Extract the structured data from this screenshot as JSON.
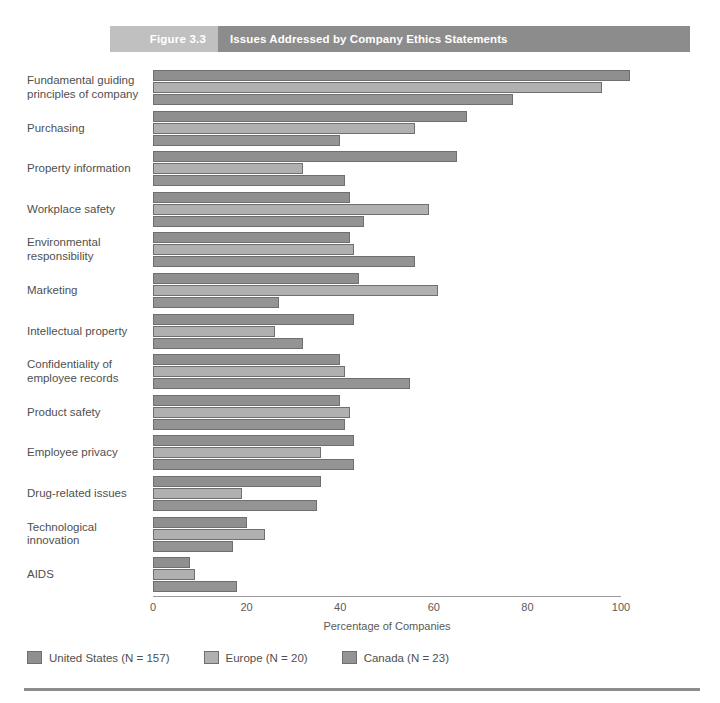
{
  "figure": {
    "number_label": "Figure 3.3",
    "title": "Issues Addressed by Company Ethics Statements"
  },
  "colors": {
    "header_num_bg": "#c0c0c0",
    "header_title_bg": "#8c8c8c",
    "united_states": "#8f8f8f",
    "europe": "#b0b0b0",
    "canada": "#949494"
  },
  "legend": {
    "items": [
      {
        "label": "United States (N = 157)",
        "color": "#8f8f8f",
        "key": "us"
      },
      {
        "label": "Europe (N = 20)",
        "color": "#b0b0b0",
        "key": "europe"
      },
      {
        "label": "Canada (N = 23)",
        "color": "#949494",
        "key": "canada"
      }
    ]
  },
  "chart_data": {
    "type": "bar",
    "orientation": "horizontal",
    "title": "Issues Addressed by Company Ethics Statements",
    "xlabel": "Percentage of Companies",
    "ylabel": "",
    "xlim": [
      0,
      100
    ],
    "xticks": [
      0,
      20,
      40,
      60,
      80,
      100
    ],
    "xtick_labels": [
      "0",
      "20",
      "40",
      "60",
      "80",
      "100"
    ],
    "grid": false,
    "legend_position": "bottom-left",
    "categories": [
      "Fundamental guiding principles of company",
      "Purchasing",
      "Property information",
      "Workplace safety",
      "Environmental responsibility",
      "Marketing",
      "Intellectual property",
      "Confidentiality of employee records",
      "Product safety",
      "Employee privacy",
      "Drug-related issues",
      "Technological innovation",
      "AIDS"
    ],
    "series": [
      {
        "name": "United States (N = 157)",
        "values": [
          102,
          67,
          65,
          42,
          42,
          44,
          43,
          40,
          40,
          43,
          36,
          20,
          8
        ]
      },
      {
        "name": "Europe (N = 20)",
        "values": [
          96,
          56,
          32,
          59,
          43,
          61,
          26,
          41,
          42,
          36,
          19,
          24,
          9
        ]
      },
      {
        "name": "Canada (N = 23)",
        "values": [
          77,
          40,
          41,
          45,
          56,
          27,
          32,
          55,
          41,
          43,
          35,
          17,
          18
        ]
      }
    ]
  },
  "axis": {
    "x_title": "Percentage of Companies"
  }
}
